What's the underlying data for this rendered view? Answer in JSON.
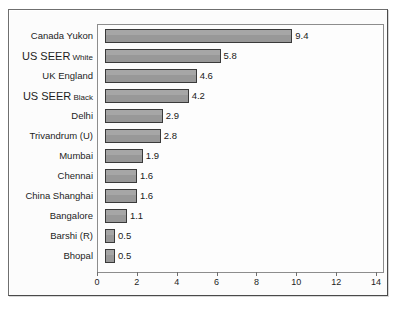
{
  "chart_data": {
    "type": "bar",
    "orientation": "horizontal",
    "title": "Age standardised incidence rates (per 100,000)",
    "xlabel": "",
    "ylabel": "",
    "xlim": [
      0,
      14
    ],
    "xticks": [
      0,
      2,
      4,
      6,
      8,
      10,
      12,
      14
    ],
    "xtick_labels": [
      "0",
      "2",
      "4",
      "6",
      "8",
      "10",
      "12",
      "14"
    ],
    "grid": false,
    "legend": false,
    "bar_color": "#9c9c9c",
    "bar_border_color": "#3a3a3a",
    "plot_border_color": "#8d8d8d",
    "frame_color": "#6f6f6f",
    "categories": [
      "Canada Yukon",
      "US SEER White",
      "UK England",
      "US SEER Black",
      "Delhi",
      "Trivandrum (U)",
      "Mumbai",
      "Chennai",
      "China Shanghai",
      "Bangalore",
      "Barshi (R)",
      "Bhopal"
    ],
    "values": [
      9.4,
      5.8,
      4.6,
      4.2,
      2.9,
      2.8,
      1.9,
      1.6,
      1.6,
      1.1,
      0.5,
      0.5
    ],
    "value_labels": [
      "9.4",
      "5.8",
      "4.6",
      "4.2",
      "2.9",
      "2.8",
      "1.9",
      "1.6",
      "1.6",
      "1.1",
      "0.5",
      "0.5"
    ],
    "rows": [
      {
        "label": "Canada Yukon",
        "label_main": "Canada Yukon",
        "label_sub": "",
        "value": 9.4,
        "value_label": "9.4"
      },
      {
        "label": "US SEER White",
        "label_main": "US SEER",
        "label_sub": "White",
        "value": 5.8,
        "value_label": "5.8"
      },
      {
        "label": "UK England",
        "label_main": "UK England",
        "label_sub": "",
        "value": 4.6,
        "value_label": "4.6"
      },
      {
        "label": "US SEER Black",
        "label_main": "US SEER",
        "label_sub": "Black",
        "value": 4.2,
        "value_label": "4.2"
      },
      {
        "label": "Delhi",
        "label_main": "Delhi",
        "label_sub": "",
        "value": 2.9,
        "value_label": "2.9"
      },
      {
        "label": "Trivandrum (U)",
        "label_main": "Trivandrum (U)",
        "label_sub": "",
        "value": 2.8,
        "value_label": "2.8"
      },
      {
        "label": "Mumbai",
        "label_main": "Mumbai",
        "label_sub": "",
        "value": 1.9,
        "value_label": "1.9"
      },
      {
        "label": "Chennai",
        "label_main": "Chennai",
        "label_sub": "",
        "value": 1.6,
        "value_label": "1.6"
      },
      {
        "label": "China Shanghai",
        "label_main": "China Shanghai",
        "label_sub": "",
        "value": 1.6,
        "value_label": "1.6"
      },
      {
        "label": "Bangalore",
        "label_main": "Bangalore",
        "label_sub": "",
        "value": 1.1,
        "value_label": "1.1"
      },
      {
        "label": "Barshi (R)",
        "label_main": "Barshi (R)",
        "label_sub": "",
        "value": 0.5,
        "value_label": "0.5"
      },
      {
        "label": "Bhopal",
        "label_main": "Bhopal",
        "label_sub": "",
        "value": 0.5,
        "value_label": "0.5"
      }
    ]
  }
}
